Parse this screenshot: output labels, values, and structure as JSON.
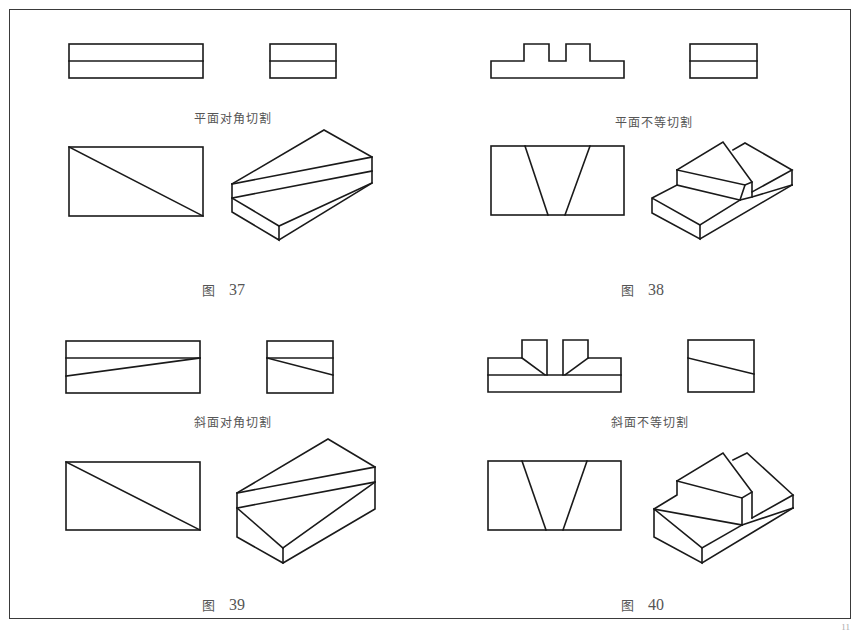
{
  "figures": [
    {
      "id": "fig37",
      "section_label": "平面对角切割",
      "caption_prefix": "图",
      "caption_number": "37"
    },
    {
      "id": "fig38",
      "section_label": "平面不等切割",
      "caption_prefix": "图",
      "caption_number": "38"
    },
    {
      "id": "fig39",
      "section_label": "斜面对角切割",
      "caption_prefix": "图",
      "caption_number": "39"
    },
    {
      "id": "fig40",
      "section_label": "斜面不等切割",
      "caption_prefix": "图",
      "caption_number": "40"
    }
  ],
  "page_number": "11",
  "colors": {
    "line": "#1a1a1a",
    "text": "#555555",
    "border": "#3a3a3a"
  }
}
